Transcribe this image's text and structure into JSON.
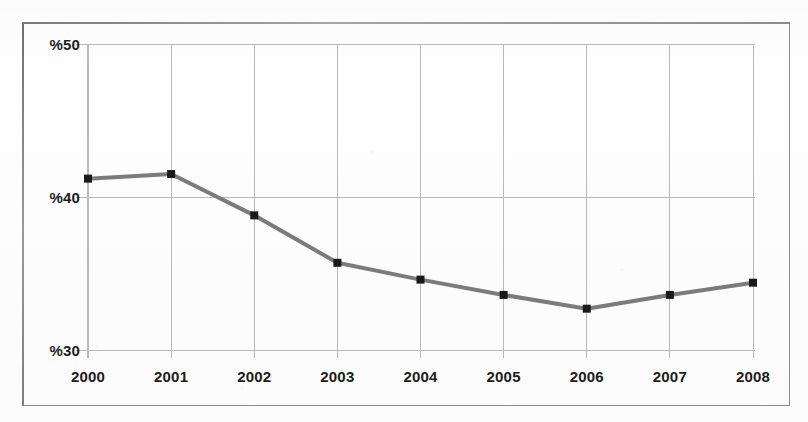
{
  "chart_data": {
    "type": "line",
    "title": "",
    "subtitle": "",
    "xlabel": "",
    "ylabel": "",
    "categories": [
      "2000",
      "2001",
      "2002",
      "2003",
      "2004",
      "2005",
      "2006",
      "2007",
      "2008"
    ],
    "values": [
      41.2,
      41.5,
      38.8,
      35.7,
      34.6,
      33.6,
      32.7,
      33.6,
      34.4
    ],
    "series": [
      {
        "name": "",
        "values": [
          41.2,
          41.5,
          38.8,
          35.7,
          34.6,
          33.6,
          32.7,
          33.6,
          34.4
        ]
      }
    ],
    "ylim": [
      30,
      50
    ],
    "yticks": [
      30,
      40,
      50
    ],
    "ytick_labels": [
      "%30",
      "%40",
      "%50"
    ],
    "xtick_labels": [
      "2000",
      "2001",
      "2002",
      "2003",
      "2004",
      "2005",
      "2006",
      "2007",
      "2008"
    ],
    "grid": true,
    "legend": "none",
    "line_color": "#7b7b7b",
    "marker_color": "#1a1a1a",
    "marker_shape": "square",
    "grid_color": "#b9b9b9",
    "frame_color": "#8b8b8b",
    "text_color": "#1c1c1c",
    "background": "#fefefe"
  },
  "axes": {
    "y_tick_labels": [
      "%50",
      "%40",
      "%30"
    ],
    "x_tick_labels": [
      "2000",
      "2001",
      "2002",
      "2003",
      "2004",
      "2005",
      "2006",
      "2007",
      "2008"
    ]
  }
}
